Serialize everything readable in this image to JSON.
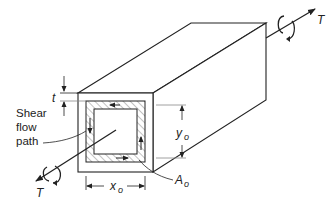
{
  "figure": {
    "labels": {
      "torque_right": "T",
      "torque_left": "T",
      "thickness": "t",
      "shear_flow_line1": "Shear",
      "shear_flow_line2": "flow",
      "shear_flow_line3": "path",
      "height": "y",
      "height_sub": "o",
      "width": "x",
      "width_sub": "o",
      "area": "A",
      "area_sub": "o"
    },
    "colors": {
      "line": "#222222",
      "hatch": "#555555",
      "background": "#ffffff"
    }
  }
}
